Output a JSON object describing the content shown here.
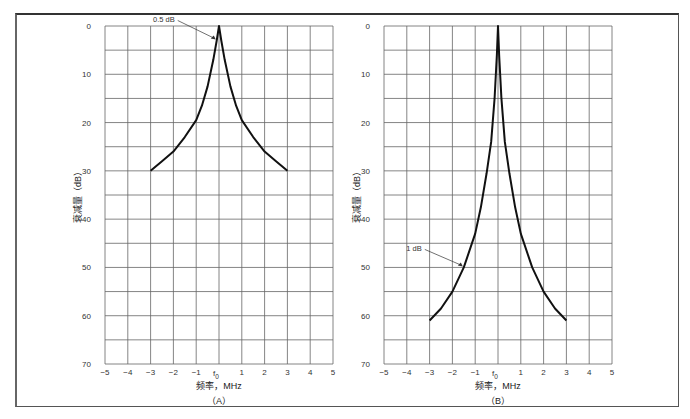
{
  "chart_data": [
    {
      "type": "line",
      "panel_label": "（A）",
      "xlabel": "频率，MHz",
      "ylabel": "衰减量（dB）",
      "x_ticks": [
        "−5",
        "−4",
        "−3",
        "−2",
        "−1",
        "f0",
        "1",
        "2",
        "3",
        "4",
        "5"
      ],
      "y_ticks": [
        "0",
        "10",
        "20",
        "30",
        "40",
        "50",
        "60",
        "70"
      ],
      "xlim": [
        -5,
        5
      ],
      "ylim": [
        0,
        70
      ],
      "y_inverted": true,
      "grid": true,
      "annotation": "0.5 dB",
      "series": [
        {
          "name": "0.5 dB",
          "x": [
            -3,
            -2.5,
            -2,
            -1.5,
            -1,
            -0.75,
            -0.5,
            -0.25,
            -0.1,
            0,
            0.1,
            0.25,
            0.5,
            0.75,
            1,
            1.5,
            2,
            2.5,
            3
          ],
          "y": [
            30,
            28,
            26,
            23,
            19.5,
            16.5,
            12.5,
            7,
            3,
            0,
            3,
            7,
            12.5,
            16.5,
            19.5,
            23,
            26,
            28,
            30
          ]
        }
      ]
    },
    {
      "type": "line",
      "panel_label": "（B）",
      "xlabel": "频率，MHz",
      "ylabel": "衰减量（dB）",
      "x_ticks": [
        "−5",
        "−4",
        "−3",
        "−2",
        "−1",
        "f0",
        "1",
        "2",
        "3",
        "4",
        "5"
      ],
      "y_ticks": [
        "0",
        "10",
        "20",
        "30",
        "40",
        "50",
        "60",
        "70"
      ],
      "xlim": [
        -5,
        5
      ],
      "ylim": [
        0,
        70
      ],
      "y_inverted": true,
      "grid": true,
      "annotation": "1 dB",
      "series": [
        {
          "name": "1 dB",
          "x": [
            -3,
            -2.5,
            -2,
            -1.5,
            -1,
            -0.75,
            -0.5,
            -0.3,
            -0.15,
            -0.05,
            0,
            0.05,
            0.15,
            0.3,
            0.5,
            0.75,
            1,
            1.5,
            2,
            2.5,
            3
          ],
          "y": [
            61,
            58.5,
            55,
            50,
            43,
            37.5,
            30.5,
            24,
            15,
            6,
            0,
            6,
            15,
            24,
            30.5,
            37.5,
            43,
            50,
            55,
            58.5,
            61
          ]
        }
      ]
    }
  ]
}
